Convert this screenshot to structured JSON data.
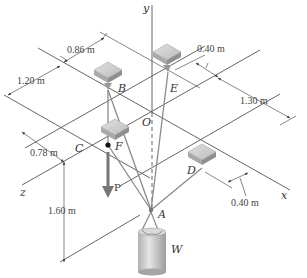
{
  "figure": {
    "type": "3D statics diagram",
    "colors": {
      "line": "#555555",
      "cable": "#888888",
      "box_top": "#d2d2d2",
      "box_side": "#a8a8a8",
      "cylinder": "#c9c9c9",
      "arrow": "#666666"
    },
    "axes": {
      "x": "x",
      "y": "y",
      "z": "z"
    },
    "points": {
      "origin": "O",
      "A": "A",
      "B": "B",
      "C": "C",
      "D": "D",
      "E": "E",
      "F": "F"
    },
    "loads": {
      "force": "P",
      "weight": "W"
    },
    "dimensions": {
      "d_086": "0.86 m",
      "d_120": "1.20 m",
      "d_040_top": "0.40 m",
      "d_130": "1.30 m",
      "d_078": "0.78 m",
      "d_160": "1.60 m",
      "d_040_bottom": "0.40 m"
    }
  }
}
